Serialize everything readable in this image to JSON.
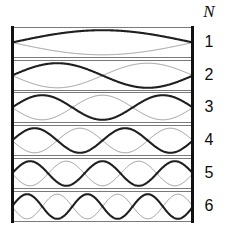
{
  "figure": {
    "column_header": "N",
    "background_color": "#ffffff",
    "box_border_color": "#7a7a7a",
    "wall_color": "#111111",
    "bold_wave_color": "#1f1f1f",
    "faint_wave_color": "#9d9d9d",
    "rows": [
      {
        "label": "1",
        "harmonic": 1
      },
      {
        "label": "2",
        "harmonic": 2
      },
      {
        "label": "3",
        "harmonic": 3
      },
      {
        "label": "4",
        "harmonic": 4
      },
      {
        "label": "5",
        "harmonic": 5
      },
      {
        "label": "6",
        "harmonic": 6
      }
    ]
  },
  "chart_data": {
    "type": "line",
    "title": "",
    "xlabel": "",
    "ylabel": "",
    "legend": [],
    "grid": false,
    "series": [
      {
        "name": "N = 1",
        "harmonic": 1,
        "half_wavelengths": 1,
        "nodes": 2,
        "antinodes": 1
      },
      {
        "name": "N = 2",
        "harmonic": 2,
        "half_wavelengths": 2,
        "nodes": 3,
        "antinodes": 2
      },
      {
        "name": "N = 3",
        "harmonic": 3,
        "half_wavelengths": 3,
        "nodes": 4,
        "antinodes": 3
      },
      {
        "name": "N = 4",
        "harmonic": 4,
        "half_wavelengths": 4,
        "nodes": 5,
        "antinodes": 4
      },
      {
        "name": "N = 5",
        "harmonic": 5,
        "half_wavelengths": 5,
        "nodes": 6,
        "antinodes": 5
      },
      {
        "name": "N = 6",
        "harmonic": 6,
        "half_wavelengths": 6,
        "nodes": 7,
        "antinodes": 6
      }
    ],
    "categories": [
      "1",
      "2",
      "3",
      "4",
      "5",
      "6"
    ],
    "values": [
      1,
      2,
      3,
      4,
      5,
      6
    ],
    "ylim": [
      -1,
      1
    ],
    "xlim": [
      0,
      1
    ]
  },
  "layout": {
    "row_tops": [
      27,
      60,
      92,
      125,
      158,
      191
    ],
    "cavity_left": 12,
    "cavity_width": 181,
    "cavity_height": 31
  }
}
